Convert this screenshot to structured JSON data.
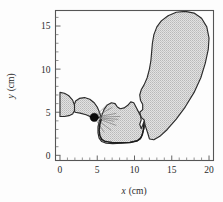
{
  "figure": {
    "title": "",
    "background_color": "#fdfdfd"
  },
  "chart_data": {
    "type": "scatter",
    "title": "",
    "subtitle": "",
    "xlabel_italic": "x",
    "xlabel_unit": "(cm)",
    "ylabel_italic": "y",
    "ylabel_unit": "(cm)",
    "xlim": [
      -0.6,
      20.6
    ],
    "ylim": [
      -0.6,
      16.8
    ],
    "xticks": [
      0,
      5,
      10,
      15,
      20
    ],
    "yticks": [
      0,
      5,
      10,
      15
    ],
    "xticklabels": [
      "0",
      "5",
      "10",
      "15",
      "20"
    ],
    "yticklabels": [
      "0",
      "5",
      "10",
      "15"
    ],
    "x_minor_tick_step": 1,
    "y_minor_tick_step": 1,
    "grid": false,
    "legend": null,
    "annotations": [
      {
        "name": "source-marker",
        "kind": "filled-circle",
        "x": 4.6,
        "y": 4.4,
        "color": "#0a0a0a",
        "radius_px": 4.2
      }
    ],
    "region_fill_color": "#cfcfcf",
    "region_outline_color": "#2b2b2b",
    "series": [
      {
        "name": "shaded-region-main",
        "kind": "filled-polygon",
        "points": [
          [
            11.5,
            3.3
          ],
          [
            11.8,
            2.5
          ],
          [
            12.0,
            1.9
          ],
          [
            12.6,
            1.8
          ],
          [
            13.4,
            2.2
          ],
          [
            14.4,
            3.0
          ],
          [
            15.6,
            4.2
          ],
          [
            16.8,
            5.6
          ],
          [
            18.0,
            7.3
          ],
          [
            18.9,
            9.0
          ],
          [
            19.5,
            10.7
          ],
          [
            19.9,
            12.3
          ],
          [
            20.0,
            13.6
          ],
          [
            19.7,
            14.9
          ],
          [
            19.0,
            15.9
          ],
          [
            18.0,
            16.5
          ],
          [
            16.8,
            16.7
          ],
          [
            15.6,
            16.6
          ],
          [
            14.5,
            16.2
          ],
          [
            13.6,
            15.6
          ],
          [
            13.0,
            14.9
          ],
          [
            12.6,
            14.0
          ],
          [
            12.4,
            13.0
          ],
          [
            12.3,
            12.0
          ],
          [
            12.2,
            11.0
          ],
          [
            12.0,
            10.0
          ],
          [
            11.7,
            9.0
          ],
          [
            11.3,
            8.2
          ],
          [
            10.9,
            7.6
          ],
          [
            10.7,
            7.0
          ],
          [
            10.8,
            6.4
          ],
          [
            11.1,
            5.9
          ],
          [
            11.1,
            5.3
          ],
          [
            10.7,
            5.0
          ],
          [
            10.9,
            4.4
          ],
          [
            11.3,
            4.1
          ],
          [
            11.4,
            3.6
          ]
        ]
      },
      {
        "name": "shaded-region-middle",
        "kind": "filled-polygon",
        "points": [
          [
            5.6,
            4.6
          ],
          [
            5.9,
            5.3
          ],
          [
            6.3,
            5.8
          ],
          [
            6.9,
            6.1
          ],
          [
            7.4,
            6.0
          ],
          [
            7.7,
            5.6
          ],
          [
            8.1,
            5.4
          ],
          [
            8.6,
            5.5
          ],
          [
            9.1,
            5.8
          ],
          [
            9.5,
            6.2
          ],
          [
            9.9,
            6.1
          ],
          [
            10.2,
            5.6
          ],
          [
            10.5,
            5.1
          ],
          [
            10.8,
            4.6
          ],
          [
            10.9,
            4.1
          ],
          [
            10.7,
            3.6
          ],
          [
            10.9,
            3.1
          ],
          [
            11.1,
            3.5
          ],
          [
            11.3,
            4.0
          ],
          [
            11.3,
            3.2
          ],
          [
            11.1,
            2.6
          ],
          [
            10.9,
            2.1
          ],
          [
            10.4,
            1.7
          ],
          [
            9.4,
            1.5
          ],
          [
            8.2,
            1.4
          ],
          [
            7.1,
            1.35
          ],
          [
            6.2,
            1.4
          ],
          [
            5.6,
            1.6
          ],
          [
            5.25,
            2.0
          ],
          [
            5.1,
            2.6
          ],
          [
            5.1,
            3.3
          ],
          [
            5.25,
            3.9
          ]
        ]
      },
      {
        "name": "shaded-region-left-lobe",
        "kind": "filled-polygon",
        "points": [
          [
            2.0,
            5.0
          ],
          [
            2.7,
            4.9
          ],
          [
            3.5,
            4.7
          ],
          [
            4.3,
            4.4
          ],
          [
            5.0,
            4.3
          ],
          [
            5.5,
            4.5
          ],
          [
            5.3,
            5.0
          ],
          [
            5.0,
            5.6
          ],
          [
            4.6,
            6.1
          ],
          [
            4.0,
            6.5
          ],
          [
            3.3,
            6.7
          ],
          [
            2.6,
            6.6
          ],
          [
            2.1,
            6.3
          ],
          [
            1.85,
            5.7
          ]
        ]
      },
      {
        "name": "shaded-region-axis-lobe",
        "kind": "filled-polygon",
        "points": [
          [
            0.0,
            7.3
          ],
          [
            0.6,
            7.2
          ],
          [
            1.2,
            6.9
          ],
          [
            1.7,
            6.4
          ],
          [
            1.95,
            5.8
          ],
          [
            1.95,
            5.2
          ],
          [
            1.7,
            4.8
          ],
          [
            1.2,
            4.6
          ],
          [
            0.6,
            4.5
          ],
          [
            0.0,
            4.5
          ]
        ]
      },
      {
        "name": "dark-boundary-curve",
        "kind": "line",
        "color": "#1b1b1b",
        "points": [
          [
            5.55,
            4.2
          ],
          [
            5.35,
            3.6
          ],
          [
            5.25,
            2.9
          ],
          [
            5.35,
            2.3
          ],
          [
            5.6,
            1.85
          ],
          [
            6.1,
            1.6
          ],
          [
            7.0,
            1.5
          ],
          [
            8.2,
            1.45
          ],
          [
            9.4,
            1.5
          ],
          [
            10.3,
            1.65
          ],
          [
            10.8,
            1.95
          ],
          [
            11.05,
            2.4
          ],
          [
            11.2,
            3.0
          ],
          [
            11.25,
            3.6
          ]
        ]
      }
    ]
  },
  "axes": {
    "frame_color": "#555555",
    "tick_color": "#555555"
  }
}
